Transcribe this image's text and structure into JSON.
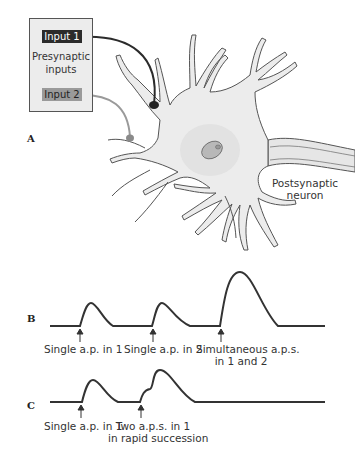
{
  "panels": {
    "a": "A",
    "b": "B",
    "c": "C"
  },
  "presynaptic_box": {
    "input1": "Input 1",
    "input2": "Input 2",
    "title_line1": "Presynaptic",
    "title_line2": "inputs",
    "colors": {
      "input1": "#2b2b2b",
      "input2": "#9a9a9a"
    }
  },
  "postsynaptic": {
    "line1": "Postsynaptic",
    "line2": "neuron"
  },
  "trace_b": {
    "labels": [
      {
        "line1": "Single a.p. in 1"
      },
      {
        "line1": "Single a.p. in 2"
      },
      {
        "line1": "Simultaneous a.p.s.",
        "line2": "in 1 and 2"
      }
    ]
  },
  "trace_c": {
    "labels": [
      {
        "line1": "Single a.p. in 1"
      },
      {
        "line1": "Two a.p.s. in 1",
        "line2": "in rapid succession"
      }
    ]
  }
}
